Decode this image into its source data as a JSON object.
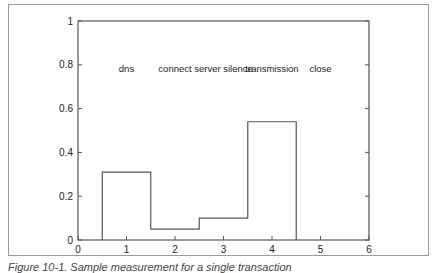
{
  "caption": "Figure 10-1. Sample measurement for a single transaction",
  "chart_data": {
    "type": "bar",
    "style": "step-outline",
    "title": "",
    "xlabel": "",
    "ylabel": "",
    "categories": [
      "dns",
      "connect",
      "server silence",
      "transmission",
      "close"
    ],
    "x": [
      1,
      2,
      3,
      4,
      5
    ],
    "values": [
      0.31,
      0.05,
      0.1,
      0.54,
      0.0
    ],
    "bar_width": 1,
    "xlim": [
      0,
      6
    ],
    "ylim": [
      0,
      1
    ],
    "xticks": [
      0,
      1,
      2,
      3,
      4,
      5,
      6
    ],
    "yticks": [
      0,
      0.2,
      0.4,
      0.6,
      0.8,
      1
    ],
    "ytick_labels": [
      "0",
      "0.2",
      "0.4",
      "0.6",
      "0.8",
      "1"
    ],
    "xtick_labels": [
      "0",
      "1",
      "2",
      "3",
      "4",
      "5",
      "6"
    ],
    "annotations_y": 0.78,
    "grid": false,
    "legend": null,
    "line_color": "#555555"
  }
}
